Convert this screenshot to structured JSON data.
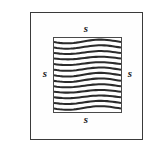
{
  "figure": {
    "kind": "geometry-diagram",
    "canvas": {
      "width": 157,
      "height": 152,
      "background_color": "#ffffff"
    },
    "outer_frame": {
      "name": "frame",
      "x": 30,
      "y": 12,
      "width": 113,
      "height": 128,
      "stroke_color": "#3a3a3a",
      "stroke_width": 1,
      "fill_color": "#fefefe"
    },
    "square": {
      "name": "hatched-square",
      "x": 53,
      "y": 37,
      "width": 69,
      "height": 76,
      "stroke_color": "#4a4a4a",
      "stroke_width": 1,
      "fill_color": "#ffffff",
      "fill_pattern": "wavy-horizontal-lines",
      "pattern_line_count": 13,
      "pattern_line_color": "#2b2b2b",
      "pattern_line_width": 2.1,
      "pattern_spacing": 5.6,
      "pattern_wave_amplitude": 1.9
    },
    "labels": [
      {
        "id": "label-top",
        "name": "side-label-top",
        "text": "s",
        "position": "top",
        "x": 86,
        "y": 28
      },
      {
        "id": "label-left",
        "name": "side-label-left",
        "text": "s",
        "position": "left",
        "x": 45,
        "y": 73
      },
      {
        "id": "label-right",
        "name": "side-label-right",
        "text": "s",
        "position": "right",
        "x": 130,
        "y": 73
      },
      {
        "id": "label-bottom",
        "name": "side-label-bottom",
        "text": "s",
        "position": "bottom",
        "x": 86,
        "y": 119
      }
    ]
  }
}
